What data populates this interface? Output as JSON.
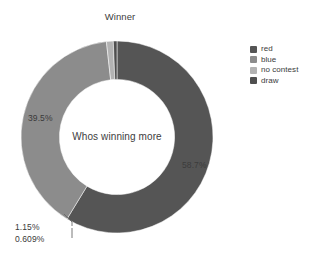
{
  "chart_data": {
    "type": "pie",
    "variant": "donut",
    "title": "Winner",
    "center_annotation": "Whos winning more",
    "categories": [
      "red",
      "blue",
      "no contest",
      "draw"
    ],
    "values": [
      58.7,
      39.5,
      1.15,
      0.609
    ],
    "value_labels": [
      "58.7%",
      "39.5%",
      "1.15%",
      "0.609%"
    ],
    "colors": [
      "#555555",
      "#8c8c8c",
      "#b3b3b3",
      "#4f4f4f"
    ],
    "units": "percent",
    "start_angle_deg": 0,
    "direction": "clockwise",
    "hole_ratio": 0.6,
    "legend": {
      "position": "right",
      "entries": [
        {
          "label": "red",
          "color": "#555555"
        },
        {
          "label": "blue",
          "color": "#8c8c8c"
        },
        {
          "label": "no contest",
          "color": "#b3b3b3"
        },
        {
          "label": "draw",
          "color": "#4f4f4f"
        }
      ]
    },
    "labels_inside": [
      "58.7%",
      "39.5%"
    ],
    "labels_callout": [
      "1.15%",
      "0.609%"
    ],
    "grid": false,
    "xlabel": "",
    "ylabel": ""
  },
  "background_color": "#ffffff",
  "text_color": "#3a3a3a"
}
